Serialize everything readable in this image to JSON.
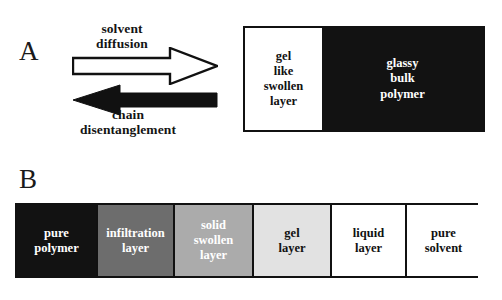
{
  "figure": {
    "panels": [
      {
        "id": "A",
        "letter": "A",
        "arrows": [
          {
            "name": "solvent-diffusion-arrow",
            "label": "solvent\ndiffusion",
            "direction": "right",
            "style": "outline",
            "fill": "#ffffff",
            "stroke": "#111111"
          },
          {
            "name": "chain-disentanglement-arrow",
            "label": "chain\ndisentanglement",
            "direction": "left",
            "style": "solid",
            "fill": "#111111",
            "stroke": "#111111"
          }
        ],
        "box": {
          "name": "polymer-solvent-interface-box",
          "border_color": "#111111",
          "regions": [
            {
              "name": "gel-like-swollen-layer",
              "label": "gel\nlike\nswollen\nlayer",
              "fill": "#ffffff",
              "text_color": "#111111"
            },
            {
              "name": "glassy-bulk-polymer",
              "label": "glassy\nbulk\npolymer",
              "fill": "#121212",
              "text_color": "#ffffff"
            }
          ]
        }
      },
      {
        "id": "B",
        "letter": "B",
        "bar": {
          "name": "dissolution-layer-bar",
          "border_color": "#111111",
          "layers": [
            {
              "name": "pure-polymer-layer",
              "label": "pure\npolymer",
              "fill": "#121212",
              "text_color": "#ffffff",
              "width_px": 81
            },
            {
              "name": "infiltration-layer",
              "label": "infiltration\nlayer",
              "fill": "#6d6d6d",
              "text_color": "#ffffff",
              "width_px": 77
            },
            {
              "name": "solid-swollen-layer",
              "label": "solid\nswollen\nlayer",
              "fill": "#ababab",
              "text_color": "#ffffff",
              "width_px": 79
            },
            {
              "name": "gel-layer",
              "label": "gel\nlayer",
              "fill": "#e2e2e2",
              "text_color": "#111111",
              "width_px": 78
            },
            {
              "name": "liquid-layer",
              "label": "liquid\nlayer",
              "fill": "#ffffff",
              "text_color": "#111111",
              "width_px": 75
            },
            {
              "name": "pure-solvent-layer",
              "label": "pure\nsolvent",
              "fill": "#ffffff",
              "text_color": "#111111",
              "width_px": 73
            }
          ]
        }
      }
    ]
  }
}
